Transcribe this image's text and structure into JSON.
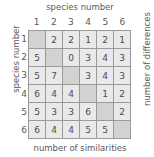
{
  "figure": {
    "top_axis_title": "species number",
    "left_axis_title": "species number",
    "right_axis_title": "number of differences",
    "bottom_axis_title": "number of similarities"
  },
  "chart_data": {
    "type": "heatmap",
    "title": "",
    "xlabel": "species number",
    "ylabel": "species number",
    "secondary_xlabel": "number of similarities",
    "secondary_ylabel": "number of differences",
    "col_headers": [
      "1",
      "2",
      "3",
      "4",
      "5",
      "6"
    ],
    "row_headers": [
      "1",
      "2",
      "3",
      "4",
      "5",
      "6"
    ],
    "cells": [
      [
        "",
        "2",
        "2",
        "1",
        "2",
        "1"
      ],
      [
        "5",
        "",
        "0",
        "3",
        "4",
        "3"
      ],
      [
        "5",
        "7",
        "",
        "3",
        "4",
        "3"
      ],
      [
        "6",
        "4",
        "4",
        "",
        "1",
        "2"
      ],
      [
        "5",
        "3",
        "3",
        "6",
        "",
        "2"
      ],
      [
        "6",
        "4",
        "4",
        "5",
        "5",
        ""
      ]
    ],
    "diagonal_blank": true,
    "upper_triangle_meaning": "number of differences",
    "lower_triangle_meaning": "number of similarities",
    "colors": {
      "cell_fill": "#e9e9e9",
      "diagonal_fill": "#d2d2d2",
      "grid_line": "#9a9a9a",
      "text": "#4d4d4d",
      "background": "#ffffff"
    }
  }
}
